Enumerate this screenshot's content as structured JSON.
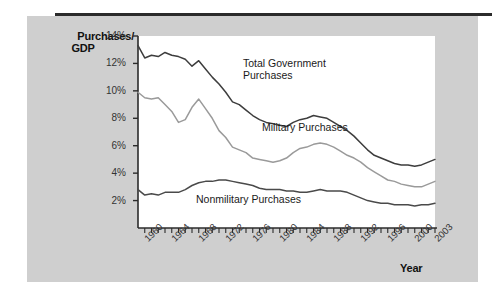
{
  "figure": {
    "background_color": "#cfcfcf",
    "plot_background_color": "#ffffff",
    "rule_color": "#2b2b2b"
  },
  "axis": {
    "y_title_line1": "Purchases/",
    "y_title_line2": "GDP",
    "x_title": "Year"
  },
  "chart_data": {
    "type": "line",
    "title": "",
    "xlabel": "Year",
    "ylabel": "Purchases/GDP",
    "xlim": [
      1959,
      2003
    ],
    "ylim": [
      0,
      14
    ],
    "grid": false,
    "legend_position": "inline-annotations",
    "ytick_labels": [
      "14%",
      "12%",
      "10%",
      "8%",
      "6%",
      "4%",
      "2%"
    ],
    "ytick_values": [
      14,
      12,
      10,
      8,
      6,
      4,
      2
    ],
    "xtick_labels": [
      "1960",
      "1964",
      "1968",
      "1972",
      "1976",
      "1980",
      "1984",
      "1988",
      "1992",
      "1996",
      "2000",
      "2003"
    ],
    "xtick_values": [
      1960,
      1964,
      1968,
      1972,
      1976,
      1980,
      1984,
      1988,
      1992,
      1996,
      2000,
      2003
    ],
    "x": [
      1959,
      1960,
      1961,
      1962,
      1963,
      1964,
      1965,
      1966,
      1967,
      1968,
      1969,
      1970,
      1971,
      1972,
      1973,
      1974,
      1975,
      1976,
      1977,
      1978,
      1979,
      1980,
      1981,
      1982,
      1983,
      1984,
      1985,
      1986,
      1987,
      1988,
      1989,
      1990,
      1991,
      1992,
      1993,
      1994,
      1995,
      1996,
      1997,
      1998,
      1999,
      2000,
      2001,
      2002,
      2003
    ],
    "series": [
      {
        "name": "Total Government Purchases",
        "color": "#3d3d3d",
        "values": [
          13.3,
          12.4,
          12.6,
          12.5,
          12.8,
          12.6,
          12.5,
          12.3,
          11.8,
          12.2,
          11.6,
          11.0,
          10.5,
          9.9,
          9.2,
          9.0,
          8.6,
          8.2,
          7.9,
          7.7,
          7.6,
          7.5,
          7.4,
          7.7,
          7.9,
          8.0,
          8.2,
          8.1,
          8.0,
          7.7,
          7.4,
          7.1,
          6.7,
          6.2,
          5.7,
          5.3,
          5.1,
          4.9,
          4.7,
          4.6,
          4.6,
          4.5,
          4.6,
          4.8,
          5.0
        ]
      },
      {
        "name": "Military Purchases",
        "color": "#9a9a9a",
        "values": [
          9.9,
          9.5,
          9.4,
          9.5,
          9.0,
          8.5,
          7.7,
          7.9,
          8.8,
          9.4,
          8.7,
          8.0,
          7.1,
          6.6,
          5.9,
          5.7,
          5.5,
          5.1,
          5.0,
          4.9,
          4.8,
          4.9,
          5.1,
          5.5,
          5.8,
          5.9,
          6.1,
          6.2,
          6.1,
          5.9,
          5.6,
          5.3,
          5.1,
          4.8,
          4.4,
          4.1,
          3.8,
          3.5,
          3.4,
          3.2,
          3.1,
          3.0,
          3.0,
          3.2,
          3.4
        ]
      },
      {
        "name": "Nonmilitary Purchases",
        "color": "#4a4a4a",
        "values": [
          2.8,
          2.4,
          2.5,
          2.4,
          2.6,
          2.6,
          2.6,
          2.8,
          3.1,
          3.3,
          3.4,
          3.4,
          3.5,
          3.5,
          3.4,
          3.3,
          3.2,
          3.1,
          2.9,
          2.8,
          2.8,
          2.8,
          2.7,
          2.7,
          2.6,
          2.6,
          2.7,
          2.8,
          2.7,
          2.7,
          2.7,
          2.6,
          2.4,
          2.2,
          2.0,
          1.9,
          1.8,
          1.8,
          1.7,
          1.7,
          1.7,
          1.6,
          1.7,
          1.7,
          1.8
        ]
      }
    ],
    "annotations": [
      {
        "text": "Total Government Purchases",
        "x": 1975,
        "y": 10.8
      },
      {
        "text": "Military Purchases",
        "x": 1979,
        "y": 6.2
      },
      {
        "text": "Nonmilitary Purchases",
        "x": 1969,
        "y": 1.5
      }
    ]
  }
}
